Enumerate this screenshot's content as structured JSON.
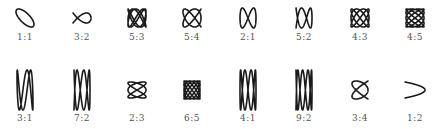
{
  "figure": {
    "title": "",
    "stroke_color": "#1a1a1a",
    "label_color": "#555555",
    "rows": [
      {
        "items": [
          {
            "label": "1:1",
            "a": 1,
            "b": 1
          },
          {
            "label": "3:2",
            "a": 3,
            "b": 2
          },
          {
            "label": "5:3",
            "a": 5,
            "b": 3
          },
          {
            "label": "5:4",
            "a": 5,
            "b": 4
          },
          {
            "label": "2:1",
            "a": 2,
            "b": 1
          },
          {
            "label": "5:2",
            "a": 5,
            "b": 2
          },
          {
            "label": "4:3",
            "a": 4,
            "b": 3
          },
          {
            "label": "4:5",
            "a": 4,
            "b": 5
          }
        ]
      },
      {
        "items": [
          {
            "label": "3:1",
            "a": 3,
            "b": 1
          },
          {
            "label": "7:2",
            "a": 7,
            "b": 2
          },
          {
            "label": "2:3",
            "a": 2,
            "b": 3
          },
          {
            "label": "6:5",
            "a": 6,
            "b": 5
          },
          {
            "label": "4:1",
            "a": 4,
            "b": 1
          },
          {
            "label": "9:2",
            "a": 9,
            "b": 2
          },
          {
            "label": "3:4",
            "a": 3,
            "b": 4
          },
          {
            "label": "1:2",
            "a": 1,
            "b": 2
          }
        ]
      }
    ]
  }
}
